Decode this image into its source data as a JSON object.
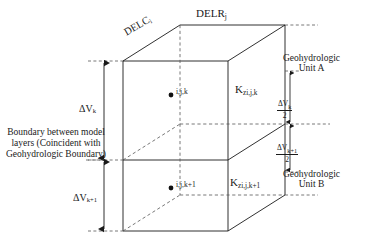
{
  "figure": {
    "type": "geohydrologic-cell-diagram",
    "colors": {
      "line": "#1a1a1a",
      "dashed": "#555555",
      "text": "#1a1a1a",
      "background": "#ffffff"
    }
  },
  "labels": {
    "delr": "DELR",
    "delr_sub": "j",
    "delc": "DELC",
    "delc_sub": "i",
    "node_upper": "i,j,k",
    "node_lower": "i,j,k+1",
    "kz_upper": "K",
    "kz_upper_sub": "zi,j,k",
    "kz_lower": "K",
    "kz_lower_sub": "zi,j,k+1",
    "unit_a_line1": "Geohydrologic",
    "unit_a_line2": "Unit A",
    "unit_b_line1": "Geohydrologic",
    "unit_b_line2": "Unit B",
    "dv_k": "ΔV",
    "dv_k_sub": "k",
    "dv_k1": "ΔV",
    "dv_k1_sub": "k+1",
    "boundary_text": "Boundary between model layers (Coincident with Geohydrologic Boundary)"
  },
  "fractions": {
    "half_dv_k": {
      "numerator": "ΔV",
      "numerator_sub": "k",
      "denominator": "2"
    },
    "half_dv_k1": {
      "numerator": "ΔV",
      "numerator_sub": "k+1",
      "denominator": "2"
    }
  },
  "dimension_markers": {
    "left_upper": "ΔV k  (thickness of model layer k)",
    "left_lower": "ΔV k+1  (thickness of model layer k+1)",
    "right_upper": "half thickness of layer k",
    "right_lower": "half thickness of layer k+1"
  }
}
